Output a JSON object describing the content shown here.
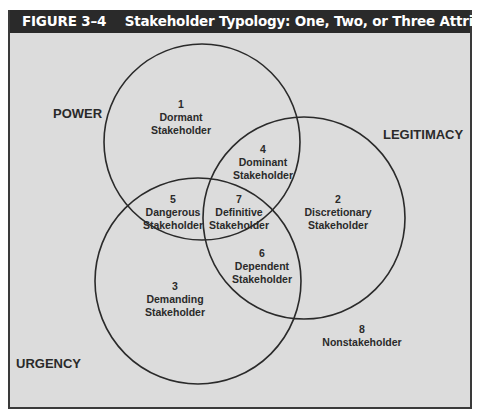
{
  "header": {
    "figure_number": "FIGURE 3–4",
    "title": "Stakeholder Typology: One, Two, or Three Attributes Present"
  },
  "attributes": {
    "power": "POWER",
    "legitimacy": "LEGITIMACY",
    "urgency": "URGENCY"
  },
  "regions": [
    {
      "number": "1",
      "line1": "Dormant",
      "line2": "Stakeholder"
    },
    {
      "number": "2",
      "line1": "Discretionary",
      "line2": "Stakeholder"
    },
    {
      "number": "3",
      "line1": "Demanding",
      "line2": "Stakeholder"
    },
    {
      "number": "4",
      "line1": "Dominant",
      "line2": "Stakeholder"
    },
    {
      "number": "5",
      "line1": "Dangerous",
      "line2": "Stakeholder"
    },
    {
      "number": "6",
      "line1": "Dependent",
      "line2": "Stakeholder"
    },
    {
      "number": "7",
      "line1": "Definitive",
      "line2": "Stakeholder"
    },
    {
      "number": "8",
      "line1": "Nonstakeholder",
      "line2": ""
    }
  ],
  "colors": {
    "panel_background": "#dcdcdc",
    "header_background": "#2a2a2a",
    "circle_stroke": "#2a2a2a"
  }
}
